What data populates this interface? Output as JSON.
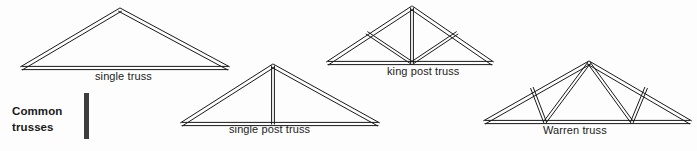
{
  "figure": {
    "section_title_line1": "Common",
    "section_title_line2": "trusses",
    "background_color": "#fdfdfd",
    "line_color": "#1a1a1a",
    "rule_color": "#3d3d3d",
    "text_color": "#1c1c1c"
  },
  "trusses": [
    {
      "id": "single-truss",
      "label": "single truss",
      "member_count": 3,
      "has_king_post": false,
      "web_pattern": "none",
      "outline": [
        [
          22,
          68
        ],
        [
          120,
          10
        ],
        [
          228,
          68
        ]
      ],
      "tie_beam": [
        [
          22,
          68
        ],
        [
          228,
          68
        ]
      ],
      "webs": []
    },
    {
      "id": "single-post-truss",
      "label": "single post truss",
      "member_count": 4,
      "has_king_post": true,
      "web_pattern": "single vertical post",
      "outline": [
        [
          182,
          124
        ],
        [
          273,
          66
        ],
        [
          378,
          124
        ]
      ],
      "tie_beam": [
        [
          182,
          124
        ],
        [
          378,
          124
        ]
      ],
      "webs": [
        [
          [
            273,
            66
          ],
          [
            273,
            124
          ]
        ]
      ]
    },
    {
      "id": "king-post-truss",
      "label": "king post truss",
      "member_count": 6,
      "has_king_post": true,
      "web_pattern": "vertical post with two struts",
      "outline": [
        [
          328,
          63
        ],
        [
          412,
          8
        ],
        [
          492,
          63
        ]
      ],
      "tie_beam": [
        [
          328,
          63
        ],
        [
          492,
          63
        ]
      ],
      "webs": [
        [
          [
            412,
            8
          ],
          [
            412,
            63
          ]
        ],
        [
          [
            412,
            63
          ],
          [
            367,
            33
          ]
        ],
        [
          [
            412,
            63
          ],
          [
            457,
            33
          ]
        ]
      ]
    },
    {
      "id": "warren-truss",
      "label": "Warren truss",
      "member_count": 7,
      "has_king_post": false,
      "web_pattern": "W-shaped diagonal webs",
      "outline": [
        [
          485,
          122
        ],
        [
          589,
          63
        ],
        [
          690,
          122
        ]
      ],
      "tie_beam": [
        [
          485,
          122
        ],
        [
          690,
          122
        ]
      ],
      "webs": [
        [
          [
            545,
            122
          ],
          [
            532,
            88
          ]
        ],
        [
          [
            545,
            122
          ],
          [
            589,
            63
          ]
        ],
        [
          [
            632,
            122
          ],
          [
            589,
            63
          ]
        ],
        [
          [
            632,
            122
          ],
          [
            646,
            88
          ]
        ]
      ]
    }
  ]
}
